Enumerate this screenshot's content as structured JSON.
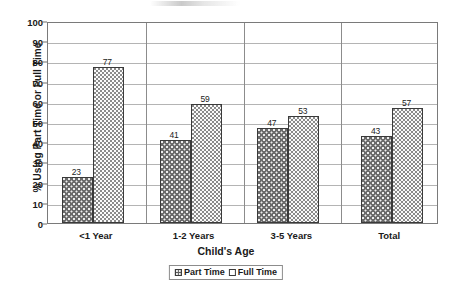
{
  "chart_data": {
    "type": "bar",
    "title": "",
    "xlabel": "Child's Age",
    "ylabel": "% Using Part Time or Full Time",
    "categories": [
      "<1 Year",
      "1-2 Years",
      "3-5 Years",
      "Total"
    ],
    "series": [
      {
        "name": "Part Time",
        "values": [
          23,
          41,
          47,
          43
        ]
      },
      {
        "name": "Full Time",
        "values": [
          77,
          59,
          53,
          57
        ]
      }
    ],
    "ylim": [
      0,
      100
    ],
    "yticks": [
      0,
      10,
      20,
      30,
      40,
      50,
      60,
      70,
      80,
      90,
      100
    ],
    "grid": true,
    "legend_position": "bottom",
    "colors": {
      "part_time": "#6a6a6a",
      "full_time": "#fbfbfb",
      "gridline": "#b4b4b4",
      "axis": "#7a7a7a"
    }
  },
  "legend": {
    "items": [
      {
        "label": "Part Time"
      },
      {
        "label": "Full Time"
      }
    ]
  }
}
